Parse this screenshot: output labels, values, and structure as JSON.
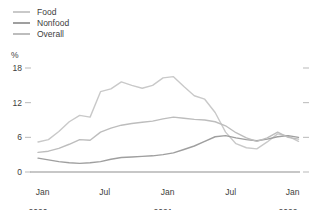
{
  "figure": {
    "background": "#ffffff",
    "text_color": "#3d3d3d",
    "unit_label": "%"
  },
  "chart_data": {
    "type": "line",
    "title": "",
    "xlabel": "",
    "ylabel": "%",
    "ylim": [
      0,
      19
    ],
    "grid": false,
    "legend_position": "top-left",
    "axis_color": "#8f8f8f",
    "tick_color": "#b9b9b9",
    "yticks": [
      "0",
      "6",
      "12",
      "18"
    ],
    "x_months": [
      "Jan 2020",
      "Feb 2020",
      "Mar 2020",
      "Apr 2020",
      "May 2020",
      "Jun 2020",
      "Jul 2020",
      "Aug 2020",
      "Sep 2020",
      "Oct 2020",
      "Nov 2020",
      "Dec 2020",
      "Jan 2021",
      "Feb 2021",
      "Mar 2021",
      "Apr 2021",
      "May 2021",
      "Jun 2021",
      "Jul 2021",
      "Aug 2021",
      "Sep 2021",
      "Oct 2021",
      "Nov 2021",
      "Dec 2021",
      "Jan 2022",
      "Feb 2022"
    ],
    "xticks": [
      {
        "label": "Jan",
        "sub": "2020",
        "month_index": 0
      },
      {
        "label": "Jul",
        "sub": "",
        "month_index": 6
      },
      {
        "label": "Jan",
        "sub": "2021",
        "month_index": 12
      },
      {
        "label": "Jul",
        "sub": "",
        "month_index": 18
      },
      {
        "label": "Jan",
        "sub": "2022",
        "month_index": 24
      }
    ],
    "series": [
      {
        "name": "Food",
        "color": "#c9c9c9",
        "values": [
          5.2,
          5.6,
          7.0,
          8.7,
          9.8,
          9.5,
          13.9,
          14.4,
          15.6,
          15.0,
          14.5,
          15.0,
          16.3,
          16.5,
          14.8,
          13.2,
          12.6,
          10.3,
          6.9,
          4.9,
          4.2,
          4.0,
          5.2,
          6.6,
          6.2,
          5.3
        ]
      },
      {
        "name": "Nonfood",
        "color": "#9f9f9f",
        "values": [
          2.4,
          2.1,
          1.8,
          1.6,
          1.5,
          1.6,
          1.8,
          2.2,
          2.5,
          2.6,
          2.7,
          2.8,
          3.0,
          3.3,
          3.9,
          4.5,
          5.3,
          6.1,
          6.3,
          5.9,
          5.6,
          5.4,
          5.7,
          6.1,
          6.3,
          6.0
        ]
      },
      {
        "name": "Overall",
        "color": "#bdbdbd",
        "values": [
          3.4,
          3.6,
          4.1,
          4.8,
          5.6,
          5.5,
          6.9,
          7.6,
          8.1,
          8.4,
          8.6,
          8.8,
          9.2,
          9.5,
          9.3,
          9.1,
          9.0,
          8.7,
          8.0,
          6.8,
          5.9,
          5.3,
          5.9,
          6.9,
          6.0,
          5.7
        ]
      }
    ]
  }
}
